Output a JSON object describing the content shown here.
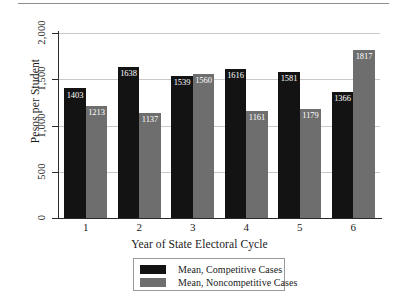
{
  "chart_data": {
    "type": "bar",
    "title": "",
    "xlabel": "Year of State Electoral Cycle",
    "ylabel": "Pesos per Student",
    "categories": [
      "1",
      "2",
      "3",
      "4",
      "5",
      "6"
    ],
    "ylim": [
      0,
      2000
    ],
    "yticks": [
      0,
      500,
      1000,
      1500,
      2000
    ],
    "ytick_labels": [
      "0",
      "500",
      "1,000",
      "1,500",
      "2,000"
    ],
    "grid": true,
    "legend_position": "bottom-center",
    "series": [
      {
        "name": "Mean, Competitive Cases",
        "color": "#131313",
        "values": [
          1403,
          1638,
          1539,
          1616,
          1581,
          1366
        ],
        "value_labels": [
          "1403",
          "1638",
          "1539",
          "1616",
          "1581",
          "1366"
        ]
      },
      {
        "name": "Mean, Noncompetitive Cases",
        "color": "#6e6e6e",
        "values": [
          1213,
          1137,
          1560,
          1161,
          1179,
          1817
        ],
        "value_labels": [
          "1213",
          "1137",
          "1560",
          "1161",
          "1179",
          "1817"
        ]
      }
    ]
  },
  "legend": {
    "entries": [
      {
        "label": "Mean, Competitive Cases"
      },
      {
        "label": "Mean, Noncompetitive Cases"
      }
    ]
  }
}
